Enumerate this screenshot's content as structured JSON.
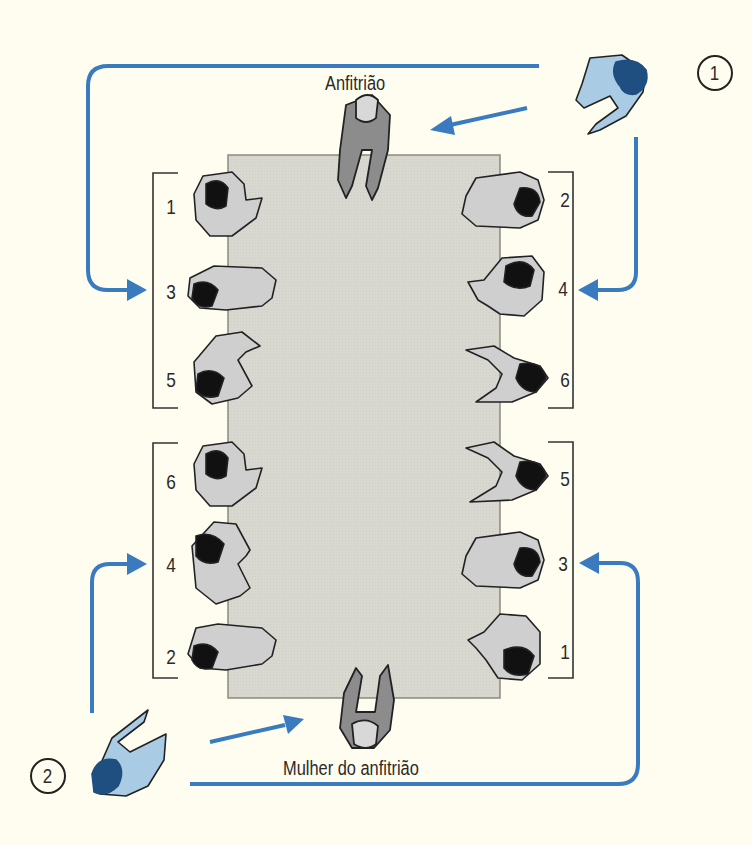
{
  "figure": {
    "colors": {
      "background": "#fffdf0",
      "table_fill": "#d9d8d0",
      "table_border": "#8a8a80",
      "arrow": "#3a7bc0",
      "guest_fill": "#a9cbe4",
      "guest_hair": "#1f4f80",
      "host_fill": "#8c8c8c",
      "seated_fill": "#cfcfcf",
      "seated_hair": "#111111",
      "outline": "#222222"
    }
  },
  "labels": {
    "host": "Anfitrião",
    "hostess": "Mulher do anfitrião"
  },
  "guests": [
    {
      "id": "guest-1",
      "badge": "1"
    },
    {
      "id": "guest-2",
      "badge": "2"
    }
  ],
  "seats": {
    "left_top": [
      "1",
      "3",
      "5"
    ],
    "right_top": [
      "2",
      "4",
      "6"
    ],
    "left_bottom": [
      "6",
      "4",
      "2"
    ],
    "right_bottom": [
      "5",
      "3",
      "1"
    ]
  }
}
